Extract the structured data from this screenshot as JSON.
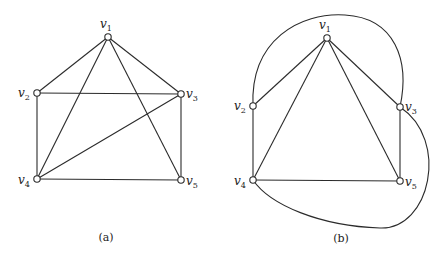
{
  "figure": {
    "graphs": [
      {
        "id": "a",
        "caption": "(a)",
        "caption_pos": [
          106,
          241
        ],
        "nodes": [
          {
            "id": "v1",
            "letter": "v",
            "sub": "1",
            "x": 108,
            "y": 37,
            "lx": 100,
            "ly": 28
          },
          {
            "id": "v2",
            "letter": "v",
            "sub": "2",
            "x": 37,
            "y": 93,
            "lx": 18,
            "ly": 97
          },
          {
            "id": "v3",
            "letter": "v",
            "sub": "3",
            "x": 181,
            "y": 94,
            "lx": 186,
            "ly": 98
          },
          {
            "id": "v4",
            "letter": "v",
            "sub": "4",
            "x": 37,
            "y": 179,
            "lx": 18,
            "ly": 184
          },
          {
            "id": "v5",
            "letter": "v",
            "sub": "5",
            "x": 181,
            "y": 180,
            "lx": 186,
            "ly": 185
          }
        ],
        "edges": [
          [
            "v1",
            "v2"
          ],
          [
            "v1",
            "v3"
          ],
          [
            "v1",
            "v4"
          ],
          [
            "v1",
            "v5"
          ],
          [
            "v2",
            "v3"
          ],
          [
            "v2",
            "v4"
          ],
          [
            "v3",
            "v4"
          ],
          [
            "v3",
            "v5"
          ],
          [
            "v4",
            "v5"
          ]
        ]
      },
      {
        "id": "b",
        "caption": "(b)",
        "caption_pos": [
          341,
          242
        ],
        "nodes": [
          {
            "id": "v1",
            "letter": "v",
            "sub": "1",
            "x": 327,
            "y": 38,
            "lx": 319,
            "ly": 29
          },
          {
            "id": "v2",
            "letter": "v",
            "sub": "2",
            "x": 253,
            "y": 106,
            "lx": 234,
            "ly": 110
          },
          {
            "id": "v3",
            "letter": "v",
            "sub": "3",
            "x": 400,
            "y": 107,
            "lx": 405,
            "ly": 111
          },
          {
            "id": "v4",
            "letter": "v",
            "sub": "4",
            "x": 253,
            "y": 180,
            "lx": 234,
            "ly": 185
          },
          {
            "id": "v5",
            "letter": "v",
            "sub": "5",
            "x": 400,
            "y": 181,
            "lx": 405,
            "ly": 186
          }
        ],
        "edges": [
          [
            "v1",
            "v2"
          ],
          [
            "v1",
            "v3"
          ],
          [
            "v1",
            "v4"
          ],
          [
            "v1",
            "v5"
          ],
          [
            "v2",
            "v4"
          ],
          [
            "v3",
            "v5"
          ],
          [
            "v4",
            "v5"
          ]
        ],
        "curved_edges": [
          {
            "from": "v2",
            "to": "v3",
            "path": "M253,106 C250,40 300,12 345,15 C395,18 410,60 400,107"
          },
          {
            "from": "v3",
            "to": "v4",
            "path": "M400,107 C450,140 430,230 380,228 C320,226 270,205 253,180"
          }
        ]
      }
    ]
  }
}
